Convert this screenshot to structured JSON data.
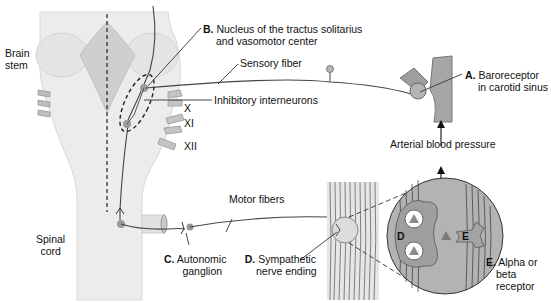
{
  "diagram": {
    "type": "baroreceptor reflex pathway",
    "colors": {
      "tissue_light": "#ececec",
      "tissue_mid": "#c9c9c9",
      "tissue_dark": "#a9a9a9",
      "neuron_body": "#9a9a9a",
      "line": "#333333",
      "circle_fill": "#b0b0b0"
    },
    "labels": {
      "brain_stem": [
        "Brain",
        "stem"
      ],
      "spinal_cord": [
        "Spinal",
        "cord"
      ],
      "nucleus": {
        "letter": "B.",
        "line1": "Nucleus of the tractus solitarius",
        "line2": "and vasomotor center"
      },
      "sensory_fiber": "Sensory fiber",
      "inhibitory": "Inhibitory interneurons",
      "cranial_x": "X",
      "cranial_xi": "XI",
      "cranial_xii": "XII",
      "baroreceptor": {
        "letter": "A.",
        "line1": "Baroreceptor",
        "line2": "in carotid sinus"
      },
      "arterial_bp": "Arterial blood pressure",
      "motor_fibers": "Motor fibers",
      "ganglion": {
        "letter": "C.",
        "line1": "Autonomic",
        "line2": "ganglion"
      },
      "nerve_ending": {
        "letter": "D.",
        "line1": "Sympathetic",
        "line2": "nerve ending"
      },
      "receptor": {
        "letter": "E.",
        "line1": "Alpha or",
        "line2": "beta",
        "line3": "receptor"
      },
      "inset_d": "D",
      "inset_e": "E"
    }
  }
}
